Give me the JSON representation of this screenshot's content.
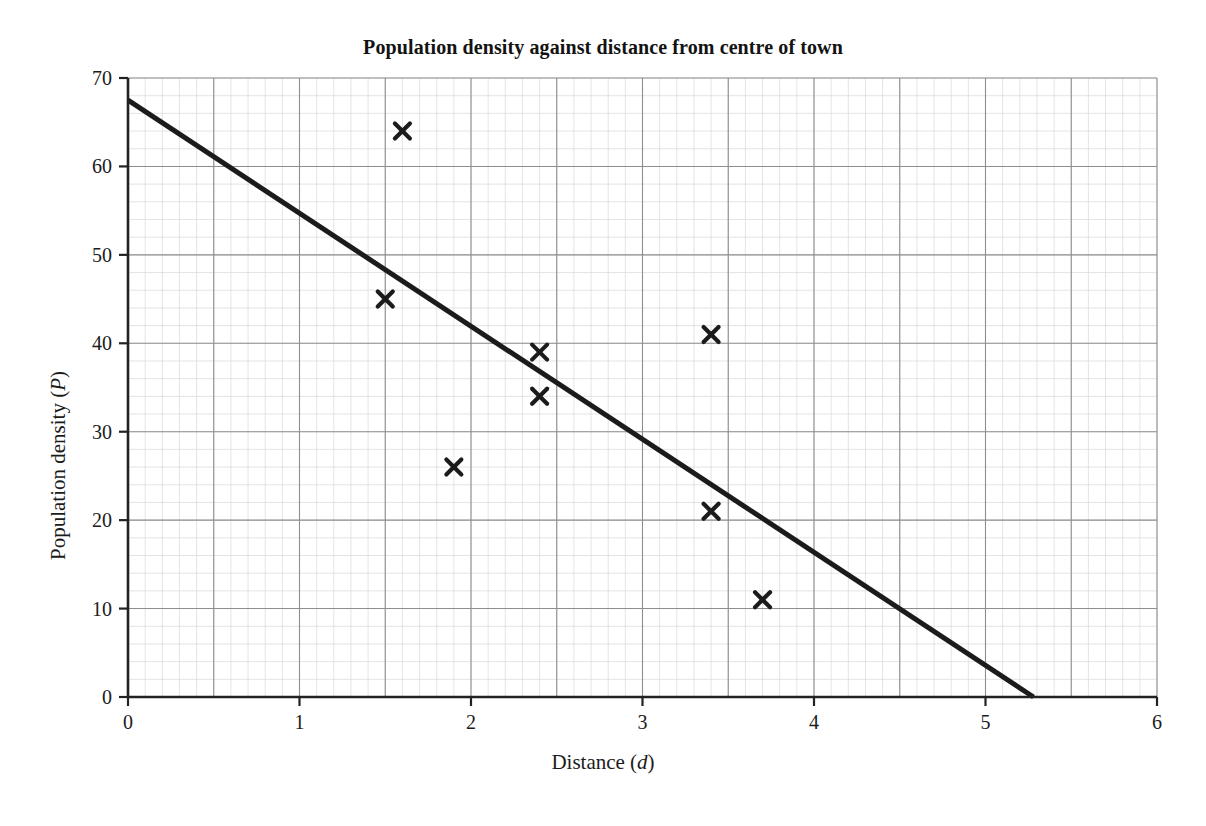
{
  "chart_data": {
    "type": "scatter",
    "title": "Population density against distance from centre of town",
    "xlabel": "Distance (d)",
    "xlabel_prefix": "Distance (",
    "xlabel_var": "d",
    "xlabel_suffix": ")",
    "ylabel": "Population density (P)",
    "ylabel_prefix": "Population density (",
    "ylabel_var": "P",
    "ylabel_suffix": ")",
    "xlim": [
      0,
      6
    ],
    "ylim": [
      0,
      70
    ],
    "xticks": [
      0,
      1,
      2,
      3,
      4,
      5,
      6
    ],
    "yticks": [
      0,
      10,
      20,
      30,
      40,
      50,
      60,
      70
    ],
    "xtick_labels": [
      "0",
      "1",
      "2",
      "3",
      "4",
      "5",
      "6"
    ],
    "ytick_labels": [
      "0",
      "10",
      "20",
      "30",
      "40",
      "50",
      "60",
      "70"
    ],
    "grid": true,
    "grid_major_x_step": 0.5,
    "grid_major_y_step": 10,
    "grid_minor_x_step": 0.1,
    "grid_minor_y_step": 2,
    "legend": "none",
    "marker": "x-cross",
    "marker_color": "#1b1b1b",
    "line_color": "#1b1b1b",
    "grid_major_color": "#8e8e8e",
    "grid_minor_color": "#d8d8d8",
    "axis_color": "#222222",
    "points": [
      {
        "x": 1.5,
        "y": 45
      },
      {
        "x": 1.6,
        "y": 64
      },
      {
        "x": 1.9,
        "y": 26
      },
      {
        "x": 2.4,
        "y": 39
      },
      {
        "x": 2.4,
        "y": 34
      },
      {
        "x": 3.4,
        "y": 41
      },
      {
        "x": 3.4,
        "y": 21
      },
      {
        "x": 3.7,
        "y": 11
      }
    ],
    "trend_line": {
      "label": "line of best fit",
      "start": {
        "x": 0,
        "y": 67.5
      },
      "end": {
        "x": 5.28,
        "y": 0
      }
    }
  }
}
